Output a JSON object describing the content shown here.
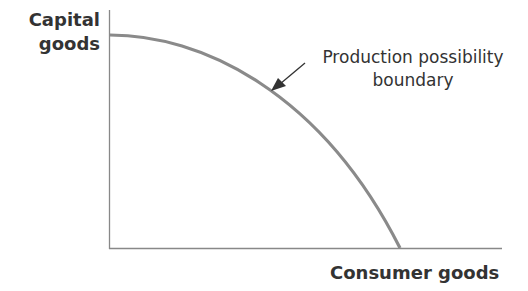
{
  "diagram": {
    "y_axis_label_line1": "Capital",
    "y_axis_label_line2": "goods",
    "x_axis_label": "Consumer goods",
    "annotation_line1": "Production possibility",
    "annotation_line2": "boundary",
    "curve_color": "#8a8a8a",
    "axis_color": "#888888",
    "text_color": "#333333"
  }
}
